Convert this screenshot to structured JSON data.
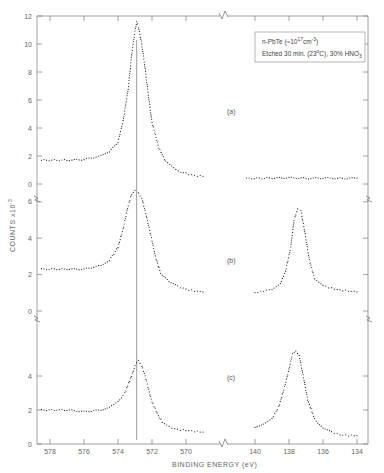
{
  "chart_data": {
    "type": "scatter",
    "title": "",
    "xlabel": "BINDING ENERGY (eV)",
    "ylabel": "COUNTS x10^-3",
    "legend": {
      "line1": "n-PbTe (~10^17 cm^-3)",
      "line2": "Etched 30 min. (23°C), 30% HNO3",
      "position": "upper right"
    },
    "x_segments": [
      {
        "name": "O 1s / Te 3d region",
        "ticks": [
          578,
          576,
          574,
          572,
          570
        ],
        "xlim": [
          578.7,
          568.3
        ]
      },
      {
        "name": "Pb 4f region",
        "ticks": [
          140,
          138,
          136,
          134
        ],
        "xlim": [
          140.9,
          133.4
        ]
      }
    ],
    "x_tick_labels": [
      "578",
      "576",
      "574",
      "572",
      "570",
      "140",
      "138",
      "136",
      "134"
    ],
    "reference_line_x": 572.9,
    "grid": false,
    "panels": [
      {
        "label": "(a)",
        "y_ticks": [
          0,
          2,
          4,
          6,
          8,
          10,
          12
        ],
        "ylim": [
          0,
          12
        ],
        "series": [
          {
            "name": "(a) 572-574 region",
            "x": [
              578.5,
              577,
              576,
              575,
              574.5,
              574,
              573.7,
              573.4,
              573.2,
              573.0,
              572.9,
              572.8,
              572.6,
              572.4,
              572.2,
              572.0,
              571.6,
              571.2,
              570.6,
              570,
              569.5,
              569
            ],
            "y": [
              1.7,
              1.7,
              1.75,
              2.0,
              2.3,
              3.0,
              4.5,
              6.8,
              9.2,
              10.9,
              11.6,
              11.2,
              10.0,
              8.2,
              6.2,
              4.4,
              2.6,
              1.6,
              1.0,
              0.75,
              0.6,
              0.55
            ]
          },
          {
            "name": "(a) 134-140 region",
            "x": [
              140.5,
              139,
              138,
              137,
              136,
              135,
              134
            ],
            "y": [
              0.4,
              0.42,
              0.45,
              0.4,
              0.43,
              0.4,
              0.42
            ]
          }
        ]
      },
      {
        "label": "(b)",
        "y_ticks": [
          0,
          2,
          4,
          6
        ],
        "ylim": [
          0,
          6.5
        ],
        "series": [
          {
            "name": "(b) 572-574 region",
            "x": [
              578.5,
              577,
              576,
              575,
              574.5,
              574,
              573.7,
              573.4,
              573.2,
              573.0,
              572.8,
              572.6,
              572.4,
              572.1,
              571.8,
              571.5,
              571.0,
              570.5,
              570,
              569.5,
              569
            ],
            "y": [
              2.3,
              2.3,
              2.3,
              2.5,
              2.8,
              3.5,
              4.5,
              5.8,
              6.4,
              6.6,
              6.5,
              6.2,
              5.5,
              4.3,
              3.0,
              2.1,
              1.6,
              1.35,
              1.2,
              1.1,
              1.05
            ]
          },
          {
            "name": "(b) 134-140 region",
            "x": [
              140,
              139.5,
              139,
              138.5,
              138.2,
              137.9,
              137.7,
              137.5,
              137.3,
              137.1,
              136.8,
              136.5,
              136,
              135.5,
              135,
              134.5,
              134
            ],
            "y": [
              1.0,
              1.1,
              1.2,
              1.5,
              2.2,
              3.5,
              5.0,
              5.6,
              5.5,
              4.5,
              2.8,
              1.8,
              1.4,
              1.25,
              1.15,
              1.1,
              1.05
            ]
          }
        ]
      },
      {
        "label": "(c)",
        "y_ticks": [
          0,
          2,
          4
        ],
        "ylim": [
          0,
          5.5
        ],
        "series": [
          {
            "name": "(c) 572-574 region",
            "x": [
              578.5,
              577,
              576,
              575,
              574.5,
              574,
              573.6,
              573.2,
              573.0,
              572.8,
              572.6,
              572.4,
              572.2,
              572.0,
              571.7,
              571.4,
              571.0,
              570.5,
              570,
              569.5,
              569
            ],
            "y": [
              2.0,
              2.0,
              1.9,
              2.0,
              2.2,
              2.5,
              3.0,
              4.0,
              4.6,
              4.9,
              4.6,
              4.0,
              3.2,
              2.5,
              1.8,
              1.3,
              1.0,
              0.85,
              0.8,
              0.75,
              0.7
            ]
          },
          {
            "name": "(c) 134-140 region",
            "x": [
              140,
              139.5,
              139,
              138.6,
              138.3,
              138.0,
              137.8,
              137.6,
              137.4,
              137.2,
              136.9,
              136.5,
              136,
              135.5,
              135,
              134.5,
              134
            ],
            "y": [
              1.0,
              1.2,
              1.5,
              2.2,
              3.2,
              4.4,
              5.3,
              5.5,
              5.2,
              4.2,
              2.6,
              1.5,
              0.9,
              0.7,
              0.55,
              0.5,
              0.5
            ]
          }
        ]
      }
    ]
  },
  "labels": {
    "panel_a": "(a)",
    "panel_b": "(b)",
    "panel_c": "(c)",
    "xlabel": "BINDING ENERGY (eV)",
    "ylabel": "COUNTS x10",
    "ylabel_exp": "-3",
    "legend_line1_prefix": "n-PbTe (≈10",
    "legend_line1_exp": "17",
    "legend_line1_mid": "cm",
    "legend_line1_exp2": "-3",
    "legend_line1_suffix": ")",
    "legend_line2_prefix": "Etched 30 min. (23",
    "legend_line2_deg": "o",
    "legend_line2_mid": "C), 30% HNO",
    "legend_line2_sub": "3"
  }
}
